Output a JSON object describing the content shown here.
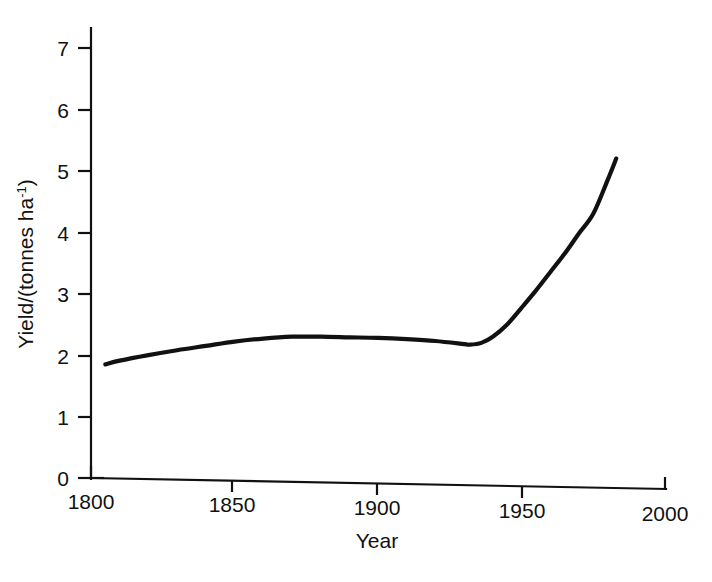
{
  "figure": {
    "background_color": "#ffffff",
    "ink_color": "#111111"
  },
  "chart_data": {
    "type": "line",
    "title": "",
    "subtitle": "",
    "xlabel": "Year",
    "ylabel": "Yield/(tonnes ha-1)",
    "ylabel_main": "Yield/(tonnes ha",
    "ylabel_superscript": "-1",
    "ylabel_tail": ")",
    "xlim": [
      1800,
      2000
    ],
    "ylim": [
      0,
      7
    ],
    "grid": false,
    "legend": null,
    "legend_position": "none",
    "x_ticks": [
      1800,
      1850,
      1900,
      1950,
      2000
    ],
    "x_tick_labels": [
      "1800",
      "1850",
      "1900",
      "1950",
      "2000"
    ],
    "y_ticks": [
      0,
      1,
      2,
      3,
      4,
      5,
      6,
      7
    ],
    "y_tick_labels": [
      "0",
      "1",
      "2",
      "3",
      "4",
      "5",
      "6",
      "7"
    ],
    "series": [
      {
        "name": "Wheat yield",
        "x": [
          1805,
          1810,
          1820,
          1830,
          1840,
          1850,
          1860,
          1870,
          1880,
          1890,
          1900,
          1910,
          1920,
          1930,
          1932,
          1936,
          1940,
          1945,
          1950,
          1955,
          1960,
          1965,
          1970,
          1975,
          1980,
          1983
        ],
        "values": [
          1.85,
          1.91,
          2.0,
          2.08,
          2.15,
          2.22,
          2.27,
          2.3,
          2.3,
          2.29,
          2.28,
          2.26,
          2.23,
          2.18,
          2.17,
          2.2,
          2.3,
          2.5,
          2.77,
          3.05,
          3.35,
          3.65,
          3.98,
          4.3,
          4.85,
          5.2
        ]
      }
    ],
    "annotations": []
  }
}
